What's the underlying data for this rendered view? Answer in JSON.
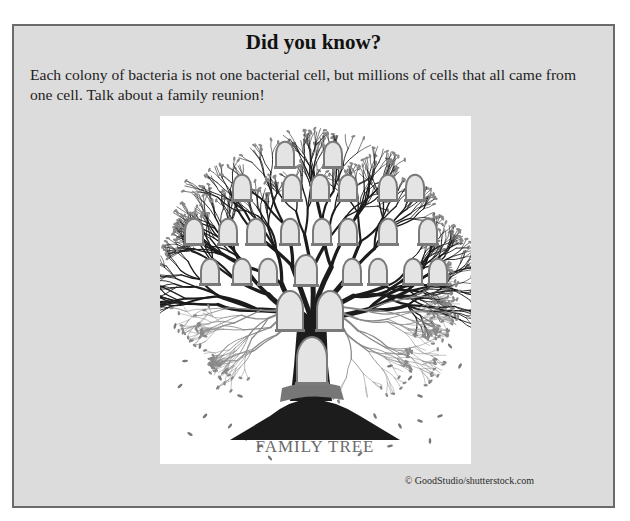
{
  "callout": {
    "title": "Did you know?",
    "body": "Each colony of bacteria is not one bacterial cell, but millions of cells that all came from one cell. Talk about a family reunion!",
    "figure": {
      "alt": "Family tree illustration with empty portrait frames on branches",
      "label": "FAMILY TREE"
    },
    "credit": "© GoodStudio/shutterstock.com"
  },
  "colors": {
    "box_background": "#dcdcdc",
    "box_border": "#6b6b6b",
    "tree_dark": "#1c1c1c",
    "frame_fill": "#e4e4e4",
    "frame_border": "#7a7a7a",
    "label": "#6a6a6a"
  }
}
